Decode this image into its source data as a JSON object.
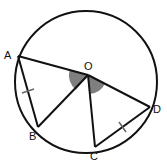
{
  "diagram": {
    "title": "",
    "circle": {
      "cx": 86,
      "cy": 82,
      "r": 71,
      "stroke": "#111111"
    },
    "center": {
      "name": "O",
      "x": 88,
      "y": 75
    },
    "points": [
      {
        "name": "A",
        "x": 18,
        "y": 56,
        "lx": 4,
        "ly": 59
      },
      {
        "name": "B",
        "x": 38,
        "y": 127,
        "lx": 29,
        "ly": 140
      },
      {
        "name": "C",
        "x": 95,
        "y": 147,
        "lx": 90,
        "ly": 160
      },
      {
        "name": "D",
        "x": 150,
        "y": 107,
        "lx": 153,
        "ly": 113
      }
    ],
    "segments": [
      "AO",
      "OB",
      "AB",
      "OC",
      "OD",
      "CD"
    ],
    "equal_marks": [
      "AB",
      "CD"
    ],
    "shaded_angles": [
      "AOB",
      "COD"
    ],
    "shade_color": "#808080",
    "labels": {
      "A": "A",
      "B": "B",
      "C": "C",
      "D": "D",
      "O": "O"
    }
  }
}
